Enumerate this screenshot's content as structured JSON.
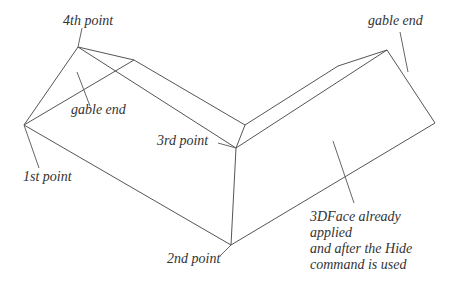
{
  "diagram": {
    "labels": {
      "fourth_point": "4th  point",
      "gable_end_left": "gable end",
      "gable_end_right": "gable end",
      "third_point": "3rd point",
      "first_point": "1st point",
      "second_point": "2nd point",
      "note_line1": "3DFace already",
      "note_line2": "applied",
      "note_line3": "and after the Hide",
      "note_line4": "command is used"
    },
    "colors": {
      "line": "#555555",
      "text": "#333333",
      "background": "#ffffff"
    }
  }
}
